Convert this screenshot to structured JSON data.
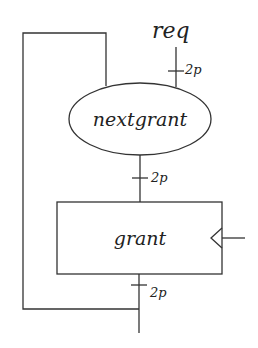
{
  "diagram": {
    "input_label": "req",
    "nodes": {
      "combinational": {
        "label": "nextgrant",
        "shape": "ellipse"
      },
      "register": {
        "label": "grant",
        "shape": "rectangle",
        "clocked": true
      }
    },
    "bus_widths": {
      "req_to_nextgrant": "2p",
      "nextgrant_to_grant": "2p",
      "grant_output": "2p"
    },
    "colors": {
      "stroke": "#333333",
      "background": "#ffffff"
    }
  }
}
